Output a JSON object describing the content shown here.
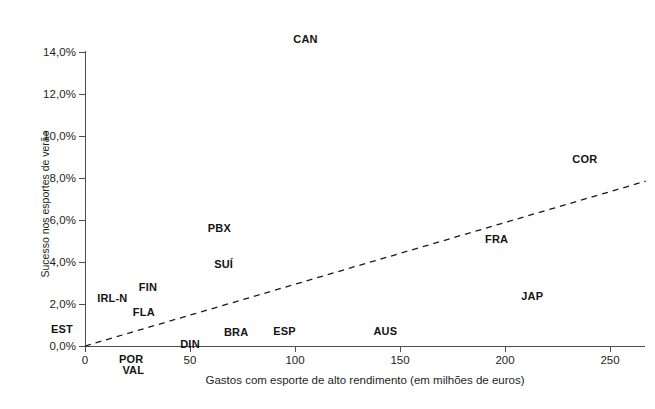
{
  "chart_data": {
    "type": "scatter",
    "title": "",
    "xlabel": "Gastos com esporte de alto rendimento (em milhões de euros)",
    "ylabel": "Sucesso nos esportes de verão",
    "xlim": [
      0,
      267
    ],
    "ylim": [
      0,
      14
    ],
    "xticks": [
      0,
      50,
      100,
      150,
      200,
      250
    ],
    "xtick_labels": [
      "0",
      "50",
      "100",
      "150",
      "200",
      "250"
    ],
    "yticks": [
      0,
      2,
      4,
      6,
      8,
      10,
      12,
      14
    ],
    "ytick_labels": [
      "0,0%",
      "2,0%",
      "4,0%",
      "6,0%",
      "8,0%",
      "10,0%",
      "12,0%",
      "14,0%"
    ],
    "grid": false,
    "legend": "none",
    "marker_style": "text-label-only",
    "points": [
      {
        "label": "CAN",
        "x": 105,
        "y": 14.6
      },
      {
        "label": "COR",
        "x": 238,
        "y": 8.9
      },
      {
        "label": "PBX",
        "x": 64,
        "y": 5.6
      },
      {
        "label": "FRA",
        "x": 196,
        "y": 5.1
      },
      {
        "label": "SUÍ",
        "x": 66,
        "y": 3.9
      },
      {
        "label": "FIN",
        "x": 30,
        "y": 2.8
      },
      {
        "label": "JAP",
        "x": 213,
        "y": 2.4
      },
      {
        "label": "IRL-N",
        "x": 13,
        "y": 2.3
      },
      {
        "label": "FLA",
        "x": 28,
        "y": 1.6
      },
      {
        "label": "BRA",
        "x": 72,
        "y": 0.65
      },
      {
        "label": "ESP",
        "x": 95,
        "y": 0.7
      },
      {
        "label": "AUS",
        "x": 143,
        "y": 0.7
      },
      {
        "label": "EST",
        "x": -11,
        "y": 0.8
      },
      {
        "label": "DIN",
        "x": 50,
        "y": 0.1
      },
      {
        "label": "POR",
        "x": 22,
        "y": -0.6
      },
      {
        "label": "VAL",
        "x": 23,
        "y": -1.15
      }
    ],
    "trendline": {
      "style": "dashed",
      "color": "#1a1a1a",
      "x_start": 0,
      "y_start": 0.0,
      "x_end": 267,
      "y_end": 7.85
    },
    "colors": {
      "axis": "#4d4d4d",
      "text": "#231f20",
      "label": "#141414",
      "background": "#ffffff"
    }
  }
}
